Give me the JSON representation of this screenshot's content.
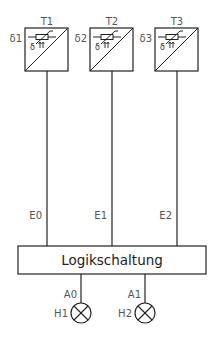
{
  "diagram": {
    "sensors": [
      {
        "id": "T1",
        "label": "T1",
        "signal": "δ1",
        "symbol_char": "δ",
        "output": "E0"
      },
      {
        "id": "T2",
        "label": "T2",
        "signal": "δ2",
        "symbol_char": "δ",
        "output": "E1"
      },
      {
        "id": "T3",
        "label": "T3",
        "signal": "δ3",
        "symbol_char": "δ",
        "output": "E2"
      }
    ],
    "logic_block": {
      "label": "Logikschaltung"
    },
    "outputs": [
      {
        "id": "A0",
        "label": "A0",
        "lamp": "H1"
      },
      {
        "id": "A1",
        "label": "A1",
        "lamp": "H2"
      }
    ],
    "colors": {
      "line": "#222222",
      "label": "#555555",
      "background": "#ffffff"
    }
  }
}
